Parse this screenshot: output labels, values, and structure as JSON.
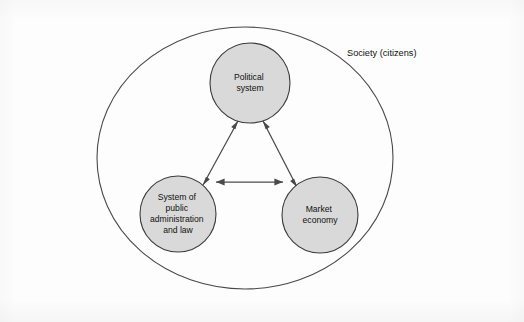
{
  "diagram": {
    "boundary": {
      "label": "Society (citizens)",
      "shape": "ellipse",
      "cx": 245,
      "cy": 158,
      "rx": 148,
      "ry": 131,
      "label_x": 347,
      "label_y": 56
    },
    "colors": {
      "node_fill": "#d9d9d9",
      "node_stroke": "#3a3a3a",
      "boundary_stroke": "#4a4a4a",
      "connector": "#4a4a4a",
      "text": "#111111",
      "background": "#fdfdfd"
    },
    "nodes": [
      {
        "id": "political-system",
        "label": "Political system",
        "lines": [
          "Political",
          "system"
        ],
        "cx": 250,
        "cy": 83,
        "r": 40
      },
      {
        "id": "public-administration",
        "label": "System of public administration and law",
        "lines": [
          "System of",
          "public",
          "administration",
          "and law"
        ],
        "cx": 178,
        "cy": 214,
        "r": 38
      },
      {
        "id": "market-economy",
        "label": "Market economy",
        "lines": [
          "Market",
          "economy"
        ],
        "cx": 320,
        "cy": 215,
        "r": 38
      }
    ],
    "connectors": [
      {
        "id": "admin-political",
        "from": "public-administration",
        "to": "political-system",
        "type": "double-arrow",
        "x1": 203,
        "y1": 185,
        "x2": 238,
        "y2": 121
      },
      {
        "id": "political-market",
        "from": "political-system",
        "to": "market-economy",
        "type": "double-arrow",
        "x1": 263,
        "y1": 121,
        "x2": 297,
        "y2": 187
      },
      {
        "id": "admin-market",
        "from": "public-administration",
        "to": "market-economy",
        "type": "double-arrow",
        "x1": 216,
        "y1": 182,
        "x2": 283,
        "y2": 182
      }
    ]
  }
}
